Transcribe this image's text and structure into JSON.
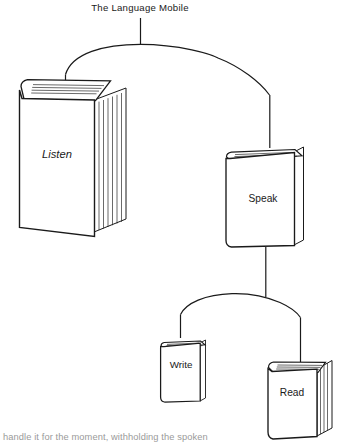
{
  "figure": {
    "title": "The Language Mobile",
    "type": "mobile-hierarchy-diagram",
    "background_color": "#ffffff",
    "line_color": "#1a1a1a",
    "caption_partial": "handle it for the moment, withholding the spoken"
  },
  "nodes": [
    {
      "id": "listen",
      "label": "Listen",
      "style": "italic",
      "size": "large",
      "level": 1,
      "branch": "left"
    },
    {
      "id": "speak",
      "label": "Speak",
      "style": "normal",
      "size": "medium",
      "level": 1,
      "branch": "right"
    },
    {
      "id": "write",
      "label": "Write",
      "style": "normal",
      "size": "small",
      "level": 2,
      "branch": "left"
    },
    {
      "id": "read",
      "label": "Read",
      "style": "normal",
      "size": "small-medium",
      "level": 2,
      "branch": "right"
    }
  ],
  "connections": [
    {
      "from": "title",
      "to": "arc-top"
    },
    {
      "from": "arc-top",
      "to": "listen"
    },
    {
      "from": "arc-top",
      "to": "speak"
    },
    {
      "from": "speak",
      "to": "arc-bottom"
    },
    {
      "from": "arc-bottom",
      "to": "write"
    },
    {
      "from": "arc-bottom",
      "to": "read"
    }
  ]
}
